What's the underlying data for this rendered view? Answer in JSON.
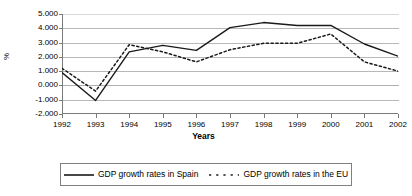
{
  "chart_data": {
    "type": "line",
    "title": "",
    "xlabel": "Years",
    "ylabel": "%",
    "x": [
      1992,
      1993,
      1994,
      1995,
      1996,
      1997,
      1998,
      1999,
      2000,
      2001,
      2002
    ],
    "xtick_labels": [
      "1992",
      "1993",
      "1994",
      "1995",
      "1996",
      "1997",
      "1998",
      "1999",
      "2000",
      "2001",
      "2002"
    ],
    "ytick_labels": [
      "5.000",
      "4.000",
      "3.000",
      "2.000",
      "1.000",
      "0.000",
      "-1.000",
      "-2.000"
    ],
    "ytick_values": [
      5,
      4,
      3,
      2,
      1,
      0,
      -1,
      -2
    ],
    "ylim": [
      -2,
      5
    ],
    "xlim": [
      1992,
      2002
    ],
    "grid": true,
    "legend_position": "bottom",
    "series": [
      {
        "name": "GDP growth rates in Spain",
        "style": "solid",
        "color": "#1a1a1a",
        "values": [
          0.9,
          -1.05,
          2.35,
          2.8,
          2.45,
          4.05,
          4.4,
          4.2,
          4.2,
          2.9,
          2.05
        ]
      },
      {
        "name": "GDP growth rates in the EU",
        "style": "dashed",
        "color": "#1a1a1a",
        "values": [
          1.2,
          -0.4,
          2.85,
          2.35,
          1.65,
          2.5,
          2.95,
          2.95,
          3.6,
          1.65,
          1.0
        ]
      }
    ]
  },
  "legend": {
    "entries": [
      {
        "label": "GDP growth rates in Spain",
        "swatch": "solid-line-swatch"
      },
      {
        "label": "GDP growth rates in the EU",
        "swatch": "dashed-line-swatch"
      }
    ]
  },
  "axes": {
    "x_title": "Years",
    "y_title": "%"
  }
}
